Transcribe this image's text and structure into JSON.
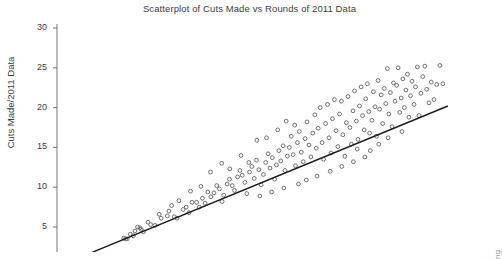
{
  "chart_data": {
    "type": "scatter",
    "title": "Scatterplot of Cuts Made vs Rounds of 2011 Data",
    "xlabel": "",
    "ylabel": "Cuts Made/2011 Data",
    "grid": false,
    "legend": null,
    "ylim": [
      0,
      30
    ],
    "xlim": [
      0,
      100
    ],
    "yticks": [
      5,
      10,
      15,
      20,
      25,
      30
    ],
    "ytick_labels": [
      "5",
      "10",
      "15",
      "20",
      "25",
      "30"
    ],
    "xticks": [],
    "xtick_labels": [],
    "x_axis_visible": false,
    "marker": "open-circle",
    "marker_color": "#6f6f6f",
    "line_color": "#1b1b1b",
    "axis_color": "#808080",
    "points": [
      [
        16.5,
        3.6
      ],
      [
        17.0,
        3.5
      ],
      [
        17.4,
        3.5
      ],
      [
        19.4,
        4.5
      ],
      [
        20.7,
        4.9
      ],
      [
        21.6,
        4.4
      ],
      [
        23.5,
        5.3
      ],
      [
        24.6,
        5.2
      ],
      [
        26.2,
        6.1
      ],
      [
        27.8,
        6.4
      ],
      [
        28.2,
        7.0
      ],
      [
        29.6,
        6.3
      ],
      [
        30.3,
        6.1
      ],
      [
        31.9,
        7.2
      ],
      [
        32.7,
        7.5
      ],
      [
        33.4,
        6.8
      ],
      [
        34.2,
        8.1
      ],
      [
        35.4,
        8.1
      ],
      [
        36.1,
        7.5
      ],
      [
        36.9,
        8.6
      ],
      [
        37.6,
        8.0
      ],
      [
        38.3,
        9.4
      ],
      [
        39.1,
        8.8
      ],
      [
        39.9,
        9.3
      ],
      [
        40.6,
        10.2
      ],
      [
        41.3,
        9.8
      ],
      [
        42.0,
        8.2
      ],
      [
        42.4,
        9.0
      ],
      [
        43.3,
        10.4
      ],
      [
        43.9,
        11.0
      ],
      [
        44.6,
        10.2
      ],
      [
        45.2,
        9.6
      ],
      [
        46.0,
        11.3
      ],
      [
        46.6,
        12.1
      ],
      [
        47.2,
        11.5
      ],
      [
        47.9,
        10.6
      ],
      [
        48.4,
        9.2
      ],
      [
        49.1,
        11.9
      ],
      [
        49.7,
        12.6
      ],
      [
        50.3,
        11.1
      ],
      [
        50.9,
        13.4
      ],
      [
        51.5,
        12.2
      ],
      [
        52.1,
        10.3
      ],
      [
        52.7,
        11.6
      ],
      [
        53.3,
        13.1
      ],
      [
        53.9,
        14.2
      ],
      [
        54.4,
        12.4
      ],
      [
        55.0,
        13.7
      ],
      [
        55.6,
        11.0
      ],
      [
        56.1,
        12.8
      ],
      [
        56.7,
        14.6
      ],
      [
        57.2,
        13.3
      ],
      [
        57.8,
        15.2
      ],
      [
        58.3,
        12.1
      ],
      [
        58.9,
        13.9
      ],
      [
        59.4,
        15.0
      ],
      [
        59.9,
        16.4
      ],
      [
        60.4,
        14.1
      ],
      [
        61.0,
        12.7
      ],
      [
        61.5,
        15.6
      ],
      [
        62.0,
        17.0
      ],
      [
        62.5,
        14.4
      ],
      [
        63.0,
        13.2
      ],
      [
        63.5,
        16.1
      ],
      [
        64.0,
        18.2
      ],
      [
        64.5,
        15.3
      ],
      [
        65.0,
        13.8
      ],
      [
        65.5,
        16.8
      ],
      [
        66.0,
        19.1
      ],
      [
        66.4,
        14.9
      ],
      [
        66.9,
        17.4
      ],
      [
        67.4,
        20.0
      ],
      [
        67.9,
        15.6
      ],
      [
        68.3,
        13.5
      ],
      [
        68.8,
        18.0
      ],
      [
        69.3,
        20.4
      ],
      [
        69.7,
        16.2
      ],
      [
        70.2,
        14.3
      ],
      [
        70.6,
        18.6
      ],
      [
        71.1,
        21.0
      ],
      [
        71.5,
        17.1
      ],
      [
        72.0,
        15.1
      ],
      [
        72.4,
        19.2
      ],
      [
        72.9,
        20.8
      ],
      [
        73.3,
        16.6
      ],
      [
        73.8,
        13.9
      ],
      [
        74.2,
        18.1
      ],
      [
        74.6,
        21.4
      ],
      [
        75.1,
        17.5
      ],
      [
        75.5,
        15.4
      ],
      [
        75.9,
        19.6
      ],
      [
        76.3,
        22.1
      ],
      [
        76.8,
        18.3
      ],
      [
        77.2,
        16.0
      ],
      [
        77.6,
        20.2
      ],
      [
        78.0,
        22.6
      ],
      [
        78.4,
        19.0
      ],
      [
        78.8,
        17.2
      ],
      [
        79.2,
        21.1
      ],
      [
        79.6,
        23.0
      ],
      [
        80.0,
        19.5
      ],
      [
        80.4,
        14.6
      ],
      [
        80.8,
        18.4
      ],
      [
        81.2,
        22.0
      ],
      [
        81.6,
        20.1
      ],
      [
        82.0,
        16.4
      ],
      [
        82.4,
        23.4
      ],
      [
        82.8,
        19.8
      ],
      [
        83.2,
        21.6
      ],
      [
        83.6,
        18.0
      ],
      [
        84.0,
        22.4
      ],
      [
        84.4,
        20.5
      ],
      [
        84.8,
        24.9
      ],
      [
        85.2,
        19.2
      ],
      [
        85.6,
        21.9
      ],
      [
        86.0,
        17.6
      ],
      [
        86.4,
        23.1
      ],
      [
        86.8,
        20.8
      ],
      [
        87.2,
        22.8
      ],
      [
        87.6,
        25.0
      ],
      [
        88.0,
        19.4
      ],
      [
        88.4,
        21.2
      ],
      [
        88.8,
        23.6
      ],
      [
        89.2,
        20.0
      ],
      [
        89.6,
        22.2
      ],
      [
        90.0,
        24.2
      ],
      [
        90.4,
        18.8
      ],
      [
        90.8,
        21.5
      ],
      [
        91.2,
        23.3
      ],
      [
        91.7,
        20.4
      ],
      [
        92.1,
        22.6
      ],
      [
        92.6,
        25.1
      ],
      [
        93.0,
        19.0
      ],
      [
        93.5,
        21.8
      ],
      [
        94.0,
        23.9
      ],
      [
        94.5,
        25.2
      ],
      [
        95.0,
        22.3
      ],
      [
        95.6,
        20.6
      ],
      [
        96.2,
        23.2
      ],
      [
        96.9,
        21.0
      ],
      [
        97.6,
        22.9
      ],
      [
        98.4,
        25.3
      ],
      [
        99.2,
        23.0
      ],
      [
        39.0,
        11.9
      ],
      [
        41.9,
        13.0
      ],
      [
        44.0,
        12.3
      ],
      [
        46.9,
        14.0
      ],
      [
        48.9,
        13.1
      ],
      [
        51.0,
        15.9
      ],
      [
        53.5,
        16.2
      ],
      [
        56.4,
        17.2
      ],
      [
        58.6,
        18.3
      ],
      [
        60.8,
        17.8
      ],
      [
        33.8,
        9.5
      ],
      [
        36.5,
        10.1
      ],
      [
        30.8,
        8.3
      ],
      [
        28.9,
        7.7
      ],
      [
        25.7,
        6.6
      ],
      [
        22.8,
        5.6
      ],
      [
        20.1,
        5.0
      ],
      [
        18.2,
        4.1
      ],
      [
        19.0,
        3.9
      ],
      [
        21.0,
        4.7
      ],
      [
        63.8,
        10.9
      ],
      [
        66.6,
        11.4
      ],
      [
        70.0,
        12.0
      ],
      [
        73.0,
        12.6
      ],
      [
        76.0,
        13.2
      ],
      [
        79.0,
        13.8
      ],
      [
        61.8,
        10.4
      ],
      [
        58.0,
        9.9
      ],
      [
        54.8,
        9.4
      ],
      [
        51.8,
        8.9
      ],
      [
        85.0,
        16.2
      ],
      [
        88.6,
        17.0
      ],
      [
        82.6,
        15.4
      ],
      [
        80.2,
        16.8
      ],
      [
        77.0,
        14.8
      ]
    ],
    "trendline": {
      "label": "linear fit",
      "x_start": 0.5,
      "y_start": 0.25,
      "x_end": 100.5,
      "y_end": 20.2
    }
  },
  "artifacts": {
    "edge_text_fragment": "ng"
  }
}
